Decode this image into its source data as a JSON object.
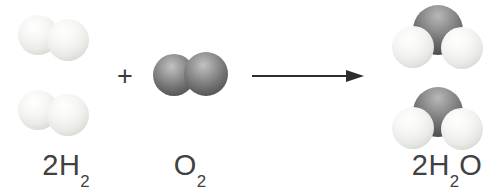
{
  "diagram": {
    "type": "chemical-reaction",
    "equation_text": "2H2 + O2 → 2H2O"
  },
  "labels": {
    "h2": {
      "pre": "2H",
      "sub": "2",
      "post": ""
    },
    "o2": {
      "pre": "O",
      "sub": "2",
      "post": ""
    },
    "h2o": {
      "pre": "2H",
      "sub": "2",
      "post": "O"
    }
  },
  "operators": {
    "plus": "+"
  },
  "molecules": {
    "h2": {
      "count": 2,
      "atoms": [
        "H",
        "H"
      ],
      "atom_color": "#eeeeec"
    },
    "o2": {
      "count": 1,
      "atoms": [
        "O",
        "O"
      ],
      "atom_color": "#6b6b6b"
    },
    "h2o": {
      "count": 2,
      "atoms": [
        "O",
        "H",
        "H"
      ],
      "oxygen_color": "#6b6b6b",
      "hydrogen_color": "#eeeeec"
    }
  },
  "colors": {
    "background": "#ffffff",
    "text": "#414141",
    "arrow": "#2d2d2d"
  }
}
